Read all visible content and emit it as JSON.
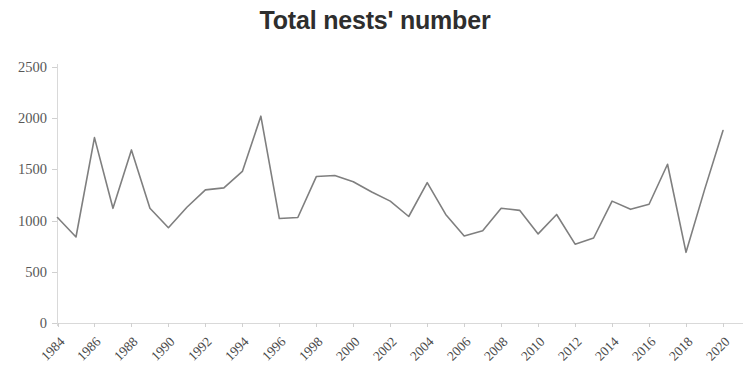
{
  "chart_data": {
    "type": "line",
    "title": "Total nests' number",
    "xlabel": "",
    "ylabel": "",
    "ylim": [
      0,
      2500
    ],
    "xlim": [
      1984,
      2020
    ],
    "grid": false,
    "legend": null,
    "legend_position": "none",
    "line_color": "#7f7f7f",
    "y_ticks": [
      0,
      500,
      1000,
      1500,
      2000,
      2500
    ],
    "y_tick_labels": [
      "0",
      "500",
      "1000",
      "1500",
      "2000",
      "2500"
    ],
    "x_tick_labels": [
      "1984",
      "1986",
      "1988",
      "1990",
      "1992",
      "1994",
      "1996",
      "1998",
      "2000",
      "2002",
      "2004",
      "2006",
      "2008",
      "2010",
      "2012",
      "2014",
      "2016",
      "2018",
      "2020"
    ],
    "x": [
      1984,
      1985,
      1986,
      1987,
      1988,
      1989,
      1990,
      1991,
      1992,
      1993,
      1994,
      1995,
      1996,
      1997,
      1998,
      1999,
      2000,
      2001,
      2002,
      2003,
      2004,
      2005,
      2006,
      2007,
      2008,
      2009,
      2010,
      2011,
      2012,
      2013,
      2014,
      2015,
      2016,
      2017,
      2018,
      2019,
      2020
    ],
    "series": [
      {
        "name": "Total nests' number",
        "values": [
          1030,
          840,
          1810,
          1120,
          1690,
          1120,
          930,
          1130,
          1300,
          1320,
          1480,
          2020,
          1020,
          1030,
          1430,
          1440,
          1380,
          1280,
          1190,
          1040,
          1370,
          1060,
          850,
          900,
          1120,
          1100,
          870,
          1060,
          770,
          830,
          1190,
          1110,
          1160,
          1550,
          690,
          1300,
          1880
        ]
      }
    ]
  },
  "axis": {
    "y_label_count": 6,
    "x_label_count": 19
  }
}
